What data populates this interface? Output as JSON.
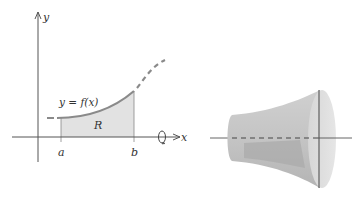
{
  "figure": {
    "left_panel": {
      "axis_x_label": "x",
      "axis_y_label": "y",
      "curve_label": "y = f(x)",
      "region_label": "R",
      "tick_a": "a",
      "tick_b": "b",
      "rotation_symbol": "rotation-about-x-axis"
    },
    "right_panel": {
      "description": "solid of revolution"
    },
    "colors": {
      "axis": "#555555",
      "curve": "#8a8a8a",
      "region_fill": "#e2e2e2",
      "solid_light": "#dedede",
      "solid_mid": "#c8c8c8",
      "solid_dark": "#a8a8a8"
    }
  }
}
